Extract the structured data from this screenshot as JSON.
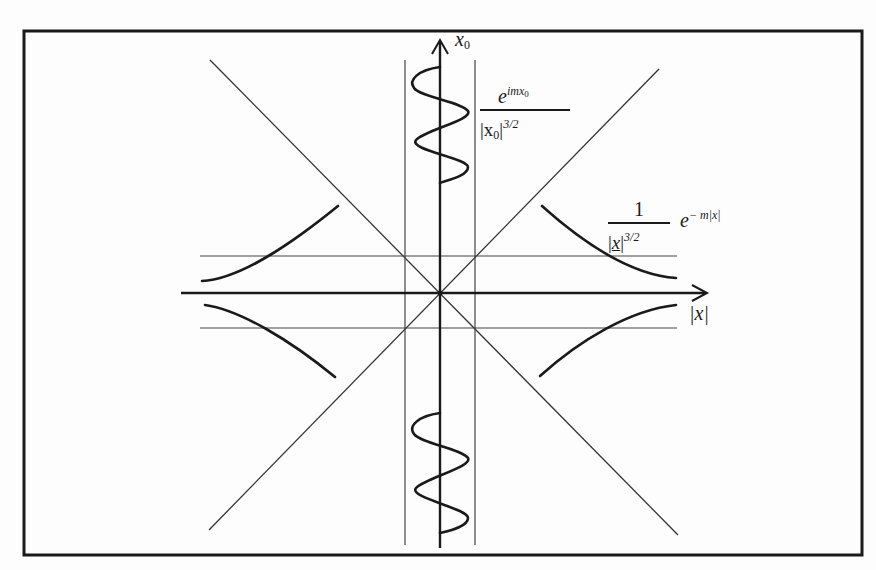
{
  "diagram": {
    "colors": {
      "ink": "#1a1a1a",
      "background": "#fdfdfd"
    },
    "frame": {
      "x1": 24,
      "y1": 31,
      "x2": 862,
      "y2": 555
    },
    "origin": {
      "x": 440,
      "y": 293
    },
    "axes": {
      "vertical": {
        "label_main": "x",
        "label_sub": "0",
        "top": 40,
        "bottom": 548
      },
      "horizontal": {
        "label": "|x|",
        "left": 181,
        "right": 707
      }
    },
    "guide_lines": {
      "vertical_x": [
        405,
        475
      ],
      "vertical_y_range": [
        60,
        545
      ],
      "horizontal_y": [
        256,
        328
      ],
      "horizontal_x_range": [
        200,
        677
      ]
    },
    "light_cone": [
      {
        "x1": 210,
        "y1": 60,
        "x2": 678,
        "y2": 535
      },
      {
        "x1": 209,
        "y1": 530,
        "x2": 659,
        "y2": 69
      }
    ],
    "annotations": {
      "timelike": {
        "numerator_base": "e",
        "numerator_exp": "imx",
        "numerator_exp_sub": "0",
        "denominator": "|x",
        "denominator_sub": "0",
        "denominator_close": "|",
        "denominator_exp": "3/2"
      },
      "spacelike_fraction": {
        "numerator": "1",
        "denominator_open": "|",
        "denominator_var": "x",
        "denominator_close": "|",
        "denominator_exp": "3/2"
      },
      "spacelike_exp": {
        "base": "e",
        "exponent": "− m|x|"
      },
      "x_axis_label": "|x|"
    }
  }
}
